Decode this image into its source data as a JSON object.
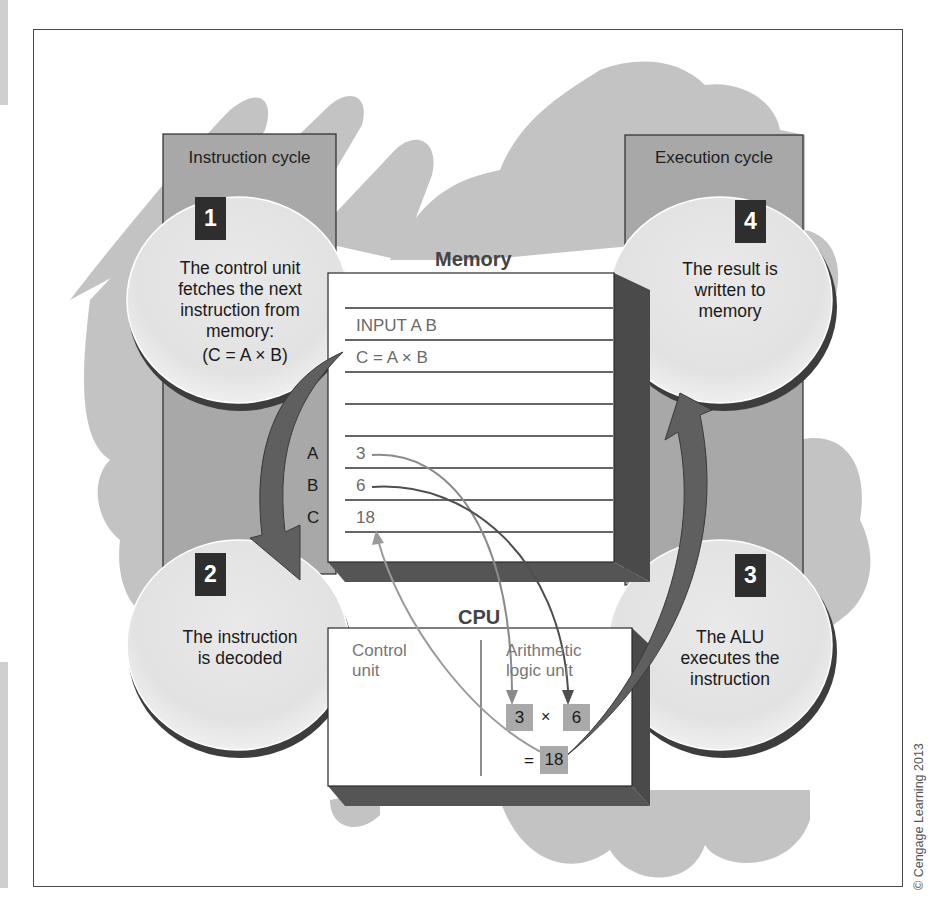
{
  "figure": {
    "columns": {
      "instruction": {
        "label": "Instruction cycle"
      },
      "execution": {
        "label": "Execution cycle"
      }
    },
    "steps": [
      {
        "number": "1",
        "lines": [
          "The control unit",
          "fetches the next",
          "instruction from",
          "memory:",
          "(C = A × B)"
        ]
      },
      {
        "number": "2",
        "lines": [
          "The instruction",
          "is decoded"
        ]
      },
      {
        "number": "3",
        "lines": [
          "The ALU",
          "executes the",
          "instruction"
        ]
      },
      {
        "number": "4",
        "lines": [
          "The result is",
          "written to",
          "memory"
        ]
      }
    ],
    "memory": {
      "label": "Memory",
      "rows": [
        "INPUT A B",
        "C = A × B",
        "",
        "",
        "3",
        "6",
        "18"
      ],
      "addresses": [
        "A",
        "B",
        "C"
      ]
    },
    "cpu": {
      "label": "CPU",
      "control_unit": [
        "Control",
        "unit"
      ],
      "alu": [
        "Arithmetic",
        "logic unit"
      ],
      "operand1": "3",
      "operator": "×",
      "operand2": "6",
      "equals": "=",
      "result": "18"
    },
    "colors": {
      "background_blob": "#bdbdbd",
      "column_fill": "#a8a8a8",
      "ellipse_fill": "#e4e4e4",
      "step_box": "#2e2e2e",
      "arrow": "#5f5f5f",
      "box_depth": "#4a4a4a"
    },
    "copyright": "© Cengage Learning 2013"
  }
}
